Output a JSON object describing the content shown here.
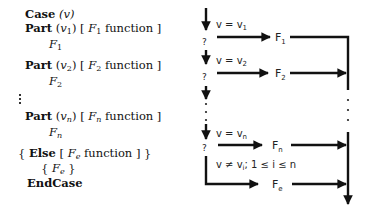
{
  "pseudocode": {
    "case_kw": "Case",
    "case_var": "(v)",
    "parts": [
      {
        "kw": "Part",
        "var": "v",
        "sub": "1",
        "fn": "F",
        "fn_sub": "1",
        "fn_word": "function",
        "body": "F",
        "body_sub": "1"
      },
      {
        "kw": "Part",
        "var": "v",
        "sub": "2",
        "fn": "F",
        "fn_sub": "2",
        "fn_word": "function",
        "body": "F",
        "body_sub": "2"
      },
      {
        "kw": "Part",
        "var": "v",
        "sub": "n",
        "fn": "F",
        "fn_sub": "n",
        "fn_word": "function",
        "body": "F",
        "body_sub": "n"
      }
    ],
    "else_kw": "Else",
    "else_fn": "F",
    "else_fn_sub": "e",
    "else_fn_word": "function",
    "else_body": "F",
    "else_body_sub": "e",
    "end_kw": "EndCase"
  },
  "flowchart": {
    "conditions": [
      "v = v",
      "v = v",
      "v = v"
    ],
    "condition_subs": [
      "1",
      "2",
      "n"
    ],
    "decision_mark": "?",
    "functions": [
      "F",
      "F",
      "F"
    ],
    "function_subs": [
      "1",
      "2",
      "n"
    ],
    "else_condition": "v ≠ v",
    "else_condition_sub": "i",
    "else_condition_tail": "; 1 ≤ i ≤ n",
    "else_function": "F",
    "else_function_sub": "e",
    "line_color": "#111111"
  }
}
